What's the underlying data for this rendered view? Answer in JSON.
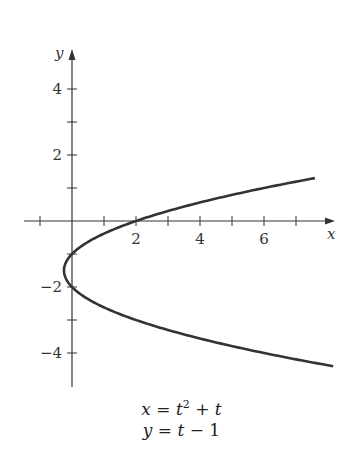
{
  "chart_data": {
    "type": "line",
    "title": "",
    "xlabel": "x",
    "ylabel": "y",
    "xlim": [
      -1,
      8.2
    ],
    "ylim": [
      -5,
      5
    ],
    "x_ticks": [
      -1,
      0,
      1,
      2,
      3,
      4,
      5,
      6,
      7
    ],
    "x_tick_labels": [
      "2",
      "4",
      "6"
    ],
    "y_ticks": [
      -5,
      -4,
      -3,
      -2,
      -1,
      0,
      1,
      2,
      3,
      4
    ],
    "y_tick_labels": [
      "4",
      "2",
      "−2",
      "−4"
    ],
    "grid": false,
    "series": [
      {
        "name": "parametric curve",
        "param": "t",
        "t_range": [
          -3.4,
          2.3
        ],
        "x_expr": "t^2 + t",
        "y_expr": "t - 1"
      }
    ],
    "annotations": [
      "x = t² + t",
      "y = t − 1"
    ]
  },
  "equations": {
    "line1_lhs": "x",
    "line1_rhs": " = t",
    "line1_sup": "2",
    "line1_tail": " + t",
    "line2": "y = t − 1"
  }
}
